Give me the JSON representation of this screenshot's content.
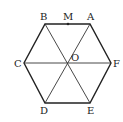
{
  "diagram": {
    "stroke_color": "#222222",
    "points": {
      "A": {
        "label": "A",
        "x": 90,
        "y": 24
      },
      "B": {
        "label": "B",
        "x": 45,
        "y": 24
      },
      "C": {
        "label": "C",
        "x": 24,
        "y": 63
      },
      "D": {
        "label": "D",
        "x": 45,
        "y": 103
      },
      "E": {
        "label": "E",
        "x": 90,
        "y": 103
      },
      "F": {
        "label": "F",
        "x": 111,
        "y": 63
      },
      "O": {
        "label": "O",
        "x": 68,
        "y": 63
      },
      "M": {
        "label": "M",
        "x": 68,
        "y": 24
      }
    },
    "edges": [
      "AB",
      "BC",
      "CD",
      "DE",
      "EF",
      "FA"
    ],
    "diagonals": [
      "AD",
      "BE",
      "CF"
    ],
    "labels": {
      "A": "A",
      "B": "B",
      "C": "C",
      "D": "D",
      "E": "E",
      "F": "F",
      "O": "O",
      "M": "M"
    }
  }
}
